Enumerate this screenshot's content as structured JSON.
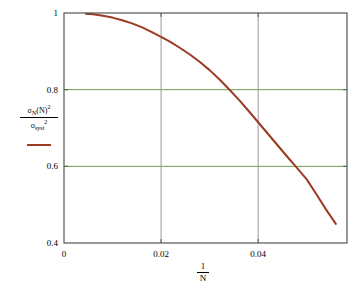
{
  "chart_data": {
    "type": "line",
    "title": "",
    "subtitle": "",
    "xlabel": "1/N",
    "xlabel_numerator": "1",
    "xlabel_denominator": "N",
    "ylabel": "sigma_N(N)^2 / sigma_syst^2",
    "ylabel_numerator_base": "σ",
    "ylabel_numerator_sub": "N",
    "ylabel_numerator_arg": "(N)",
    "ylabel_numerator_sup": "2",
    "ylabel_denominator_base": "σ",
    "ylabel_denominator_sub": "syst",
    "ylabel_denominator_sup": "2",
    "xlim": [
      0,
      0.0583
    ],
    "ylim": [
      0.4,
      1.0
    ],
    "xticks": [
      0,
      0.02,
      0.04
    ],
    "xticklabels": [
      "0",
      "0.02",
      "0.04"
    ],
    "yticks": [
      0.4,
      0.6,
      0.8,
      1
    ],
    "yticklabels": [
      "0.4",
      "0.6",
      "0.8",
      "1"
    ],
    "grid": {
      "horizontal_values": [
        0.6,
        0.8
      ],
      "horizontal_color": "#6b9e4e",
      "vertical_values": [
        0.02,
        0.04
      ],
      "vertical_color": "#9a9a9a"
    },
    "legend": {
      "position": "none",
      "entries": []
    },
    "frame_color": "#555555",
    "background": "#ffffff",
    "series": [
      {
        "name": "sigma ratio",
        "color": "#9c3a22",
        "linewidth": 2,
        "x": [
          0.0045,
          0.006,
          0.008,
          0.01,
          0.012,
          0.014,
          0.016,
          0.018,
          0.02,
          0.022,
          0.024,
          0.026,
          0.028,
          0.03,
          0.032,
          0.034,
          0.036,
          0.038,
          0.04,
          0.042,
          0.044,
          0.046,
          0.048,
          0.05,
          0.052,
          0.054,
          0.056
        ],
        "y": [
          0.998,
          0.997,
          0.993,
          0.988,
          0.981,
          0.973,
          0.963,
          0.951,
          0.938,
          0.924,
          0.908,
          0.891,
          0.872,
          0.851,
          0.827,
          0.801,
          0.774,
          0.745,
          0.715,
          0.685,
          0.655,
          0.625,
          0.596,
          0.566,
          0.527,
          0.487,
          0.45
        ]
      }
    ]
  }
}
